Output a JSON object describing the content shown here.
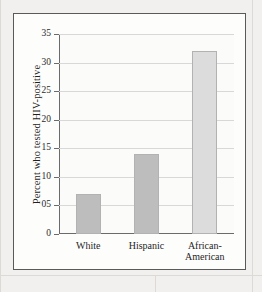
{
  "figure": {
    "panel_name": "bar-chart-figure"
  },
  "chart_data": {
    "type": "bar",
    "title": "",
    "xlabel": "",
    "ylabel": "Percent who tested HIV-positive",
    "categories": [
      "White",
      "Hispanic",
      "African-\nAmerican"
    ],
    "values": [
      7,
      14,
      32
    ],
    "bar_colors": [
      "#bdbdbd",
      "#bdbdbd",
      "#dcdcdc"
    ],
    "ylim": [
      0,
      35
    ],
    "yticks": [
      0,
      5,
      10,
      15,
      20,
      25,
      30,
      35
    ],
    "ytick_labels": [
      "0",
      "05",
      "10",
      "15",
      "20",
      "25",
      "30",
      "35"
    ],
    "grid": true,
    "legend": "none"
  },
  "colors": {
    "page_background": "#f2f0ee",
    "panel_background": "#fdfdfc",
    "panel_border": "#5a5a5a",
    "axis": "#6b6b6b",
    "gridline": "#d8d8d8",
    "text": "#1f1f1f"
  }
}
